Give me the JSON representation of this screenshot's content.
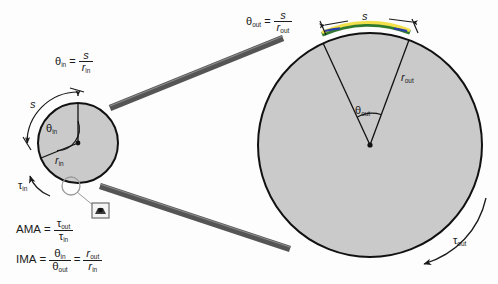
{
  "diagram": {
    "colors": {
      "wheel_fill": "#cacaca",
      "wheel_stroke": "#111111",
      "belt": "#555555",
      "arc_highlight_yellow": "#f2e14c",
      "arc_highlight_green": "#2f7a2f",
      "arc_highlight_blue": "#2c3fa8",
      "text": "#1a1a1a"
    },
    "labels": {
      "theta": "θ",
      "tau": "τ",
      "r": "r",
      "s": "s",
      "in": "in",
      "out": "out",
      "equals": "="
    },
    "input_wheel": {
      "name": "input pulley",
      "radius_label": "r",
      "radius_sub": "in",
      "angle_label": "θ",
      "angle_sub": "in",
      "arc_label": "s",
      "torque_label": "τ",
      "torque_sub": "in"
    },
    "output_wheel": {
      "name": "output pulley",
      "radius_label": "r",
      "radius_sub": "out",
      "angle_label": "θ",
      "angle_sub": "out",
      "arc_label": "s",
      "torque_label": "τ",
      "torque_sub": "out"
    },
    "equations": [
      {
        "id": "theta-in",
        "lhs": "θ",
        "lhs_sub": "in",
        "numerator": "s",
        "num_sub": "",
        "denominator": "r",
        "den_sub": "in"
      },
      {
        "id": "theta-out",
        "lhs": "θ",
        "lhs_sub": "out",
        "numerator": "s",
        "num_sub": "",
        "denominator": "r",
        "den_sub": "out"
      },
      {
        "id": "ama",
        "lhs": "AMA",
        "numerator": "τ",
        "num_sub": "out",
        "denominator": "τ",
        "den_sub": "in"
      },
      {
        "id": "ima",
        "lhs": "IMA",
        "numerator": "θ",
        "num_sub": "in",
        "denominator": "θ",
        "den_sub": "out",
        "numerator2": "r",
        "num2_sub": "out",
        "denominator2": "r",
        "den2_sub": "in"
      }
    ]
  }
}
